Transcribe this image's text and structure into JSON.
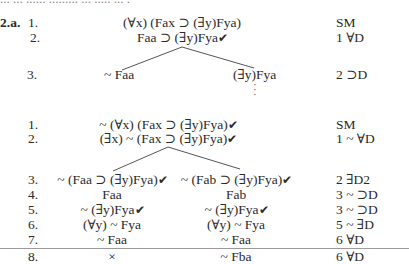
{
  "page_top_fragment": "... ... ...... ......... ... ..... ... .",
  "exercise_label": "2.a.",
  "tree1": {
    "rows": [
      {
        "num": "1.",
        "formula": "(∀x) (Fax ⊃ (∃y)Fya)",
        "checked": false,
        "just": "SM"
      },
      {
        "num": "2.",
        "formula": "Faa ⊃ (∃y)Fya",
        "checked": true,
        "just": "1 ∀D"
      }
    ],
    "branch_row": {
      "num": "3.",
      "left": "~ Faa",
      "right": "(∃y)Fya",
      "just": "2 ⊃D"
    },
    "continuation": "⋮"
  },
  "tree2": {
    "rows": [
      {
        "num": "1.",
        "formula": "~ (∀x) (Fax ⊃ (∃y)Fya)",
        "checked": true,
        "just": "SM"
      },
      {
        "num": "2.",
        "formula": "(∃x) ~ (Fax ⊃ (∃y)Fya)",
        "checked": true,
        "just": "1 ~ ∀D"
      }
    ],
    "branch_rows": [
      {
        "num": "3.",
        "left": "~ (Faa ⊃ (∃y)Fya)",
        "left_checked": true,
        "right": "~ (Fab ⊃ (∃y)Fya)",
        "right_checked": true,
        "just": "2 ∃D2"
      },
      {
        "num": "4.",
        "left": "Faa",
        "left_checked": false,
        "right": "Fab",
        "right_checked": false,
        "just": "3 ~ ⊃D"
      },
      {
        "num": "5.",
        "left": "~ (∃y)Fya",
        "left_checked": true,
        "right": "~ (∃y)Fya",
        "right_checked": true,
        "just": "3 ~ ⊃D"
      },
      {
        "num": "6.",
        "left": "(∀y) ~ Fya",
        "left_checked": false,
        "right": "(∀y) ~ Fya",
        "right_checked": false,
        "just": "5 ~ ∃D"
      },
      {
        "num": "7.",
        "left": "~ Faa",
        "left_checked": false,
        "right": "~ Faa",
        "right_checked": false,
        "just": "6 ∀D"
      },
      {
        "num": "8.",
        "left": "×",
        "left_checked": false,
        "right": "~ Fba",
        "right_checked": false,
        "just": "6 ∀D"
      }
    ]
  },
  "check_glyph": "✔",
  "colors": {
    "text": "#2a2a2a",
    "lines": "#555555",
    "rule": "#9a9a9a"
  }
}
